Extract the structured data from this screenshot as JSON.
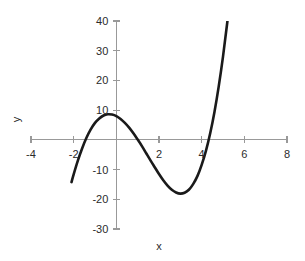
{
  "chart_data": {
    "type": "line",
    "title": "",
    "xlabel": "x",
    "ylabel": "y",
    "xlim": [
      -4,
      8
    ],
    "ylim": [
      -30,
      40
    ],
    "xticks": [
      -4,
      -2,
      0,
      2,
      4,
      6,
      8
    ],
    "yticks": [
      -30,
      -20,
      -10,
      0,
      10,
      20,
      30,
      40
    ],
    "xtick_labels": [
      "-4",
      "-2",
      "",
      "2",
      "4",
      "6",
      "8"
    ],
    "ytick_labels": [
      "-30",
      "-20",
      "-10",
      "",
      "10",
      "20",
      "30",
      "40"
    ],
    "grid": false,
    "legend": null,
    "series": [
      {
        "name": "cubic",
        "color": "#1a1a1a",
        "line_width": 2.6,
        "x": [
          -2.1,
          -2.0,
          -1.8,
          -1.6,
          -1.4,
          -1.2,
          -1.0,
          -0.8,
          -0.6,
          -0.4,
          -0.2,
          0.0,
          0.2,
          0.4,
          0.6,
          0.8,
          1.0,
          1.2,
          1.4,
          1.6,
          1.8,
          2.0,
          2.2,
          2.4,
          2.6,
          2.8,
          3.0,
          3.2,
          3.4,
          3.6,
          3.8,
          4.0,
          4.2,
          4.4,
          4.6,
          4.8,
          5.0,
          5.2,
          5.4,
          5.6,
          5.8,
          6.0,
          6.1
        ],
        "y": [
          -14.2,
          -11.6,
          -6.9,
          -2.8,
          0.7,
          3.5,
          5.7,
          7.2,
          8.2,
          8.6,
          8.5,
          8.0,
          7.0,
          5.7,
          4.1,
          2.2,
          0.1,
          -2.1,
          -4.5,
          -6.9,
          -9.2,
          -11.5,
          -13.6,
          -15.4,
          -16.8,
          -17.7,
          -18.1,
          -17.8,
          -16.8,
          -14.9,
          -12.2,
          -8.4,
          -3.7,
          2.2,
          9.4,
          18.0,
          28.0,
          39.5,
          52.5,
          67.1,
          83.4,
          101.3,
          110.7
        ],
        "notes": "cubic curve; local max about +5 near x=0, local min about -17 near x=3.5, rises steeply after x=5"
      }
    ],
    "annotations": [],
    "axis_style": {
      "axis_color": "#999999",
      "tick_color": "#999999",
      "x_axis_at_y": 0,
      "y_axis_at_x": 0,
      "spines": "cross-at-origin"
    }
  },
  "axis_titles": {
    "x": "x",
    "y": "y"
  }
}
